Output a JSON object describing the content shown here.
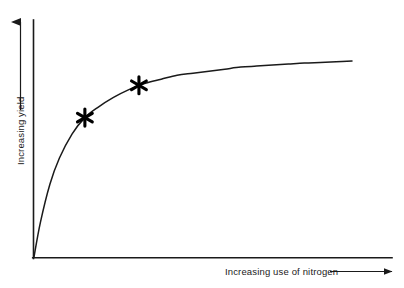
{
  "chart_data": {
    "type": "line",
    "title": "",
    "subtitle": "",
    "xlabel": "Increasing use of nitrogen",
    "ylabel": "Increasing yield",
    "grid": false,
    "legend": null,
    "legend_position": "none",
    "axis_style": "qualitative-arrows-no-ticks",
    "xtick_labels": [],
    "ytick_labels": [],
    "xlim": [
      0,
      100
    ],
    "ylim": [
      0,
      100
    ],
    "curve_label": "diminishing returns yield response curve",
    "series": [
      {
        "name": "Yield response to nitrogen",
        "description": "Saturating curve of diminishing returns",
        "x": [
          0,
          2,
          5,
          8,
          12,
          16,
          20,
          25,
          30,
          35,
          40,
          45,
          50,
          55,
          60,
          65,
          70,
          75,
          80,
          85,
          90,
          95,
          100
        ],
        "y": [
          0,
          17,
          36,
          49,
          61,
          69,
          74,
          79,
          83,
          86,
          88,
          90,
          91,
          92,
          93,
          94,
          94.5,
          95,
          95.5,
          96,
          96.3,
          96.6,
          97
        ]
      }
    ],
    "annotations": [
      {
        "name": "marker-1",
        "symbol": "asterisk",
        "x": 16,
        "y": 69,
        "label": ""
      },
      {
        "name": "marker-2",
        "symbol": "asterisk",
        "x": 33,
        "y": 85,
        "label": ""
      }
    ],
    "colors": {
      "curve": "#1a1a1a",
      "axis": "#1a1a1a",
      "marker": "#000000",
      "background": "#ffffff",
      "text": "#1a1a1a"
    }
  },
  "axes": {
    "x": {
      "label": "Increasing use of nitrogen",
      "arrow_icon": "arrow-right-icon"
    },
    "y": {
      "label": "Increasing yield",
      "arrow_icon": "arrow-up-icon"
    }
  },
  "markers": {
    "first_label": "",
    "second_label": ""
  }
}
